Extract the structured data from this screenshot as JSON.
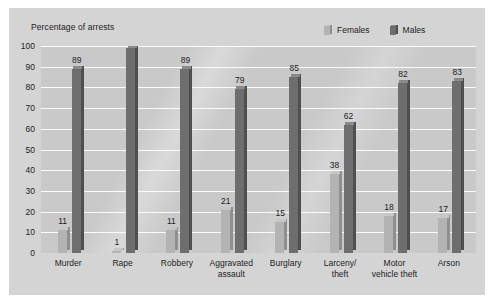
{
  "chart_data": {
    "type": "bar",
    "title": "Percentage of arrests",
    "xlabel": "",
    "ylabel": "Percentage of arrests",
    "ylim": [
      0,
      100
    ],
    "ytick_step": 10,
    "yticks": [
      100,
      90,
      80,
      70,
      60,
      50,
      40,
      30,
      20,
      10,
      0
    ],
    "grid": true,
    "legend_position": "top-right",
    "categories": [
      "Murder",
      "Rape",
      "Robbery",
      "Aggravated\nassault",
      "Burglary",
      "Larceny/\ntheft",
      "Motor\nvehicle theft",
      "Arson"
    ],
    "series": [
      {
        "name": "Females",
        "color": "#b3b3b3",
        "values": [
          11,
          1,
          11,
          21,
          15,
          38,
          18,
          17
        ]
      },
      {
        "name": "Males",
        "color": "#6e6e6e",
        "values": [
          89,
          99,
          89,
          79,
          85,
          62,
          82,
          83
        ]
      }
    ]
  },
  "legend": {
    "items": [
      {
        "label": "Females",
        "swatch": "legend-swatch-females"
      },
      {
        "label": "Males",
        "swatch": "legend-swatch-males"
      }
    ]
  },
  "colors": {
    "page_background": "#ffffff",
    "card_background": "#d4d4d4",
    "plot_background": "#c9c9c9",
    "gridline": "#fbfbfb",
    "females_face": "#b3b3b3",
    "females_side": "#8f8f8f",
    "females_top": "#c6c6c6",
    "males_face": "#6e6e6e",
    "males_side": "#4f4f4f",
    "males_top": "#8a8a8a",
    "text": "#1d1d1d"
  }
}
